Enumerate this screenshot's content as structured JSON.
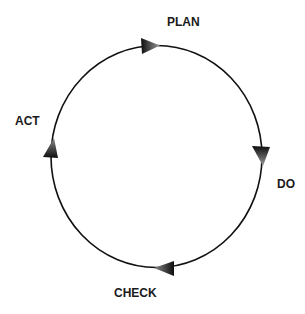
{
  "diagram": {
    "type": "cycle",
    "direction": "clockwise",
    "stages": [
      {
        "label": "PLAN",
        "position": "top"
      },
      {
        "label": "DO",
        "position": "right"
      },
      {
        "label": "CHECK",
        "position": "bottom"
      },
      {
        "label": "ACT",
        "position": "left"
      }
    ],
    "colors": {
      "line": "#111111",
      "arrow_dark": "#111111",
      "arrow_light": "#9a9a9a",
      "text": "#1a1a1a",
      "background": "#ffffff"
    }
  }
}
